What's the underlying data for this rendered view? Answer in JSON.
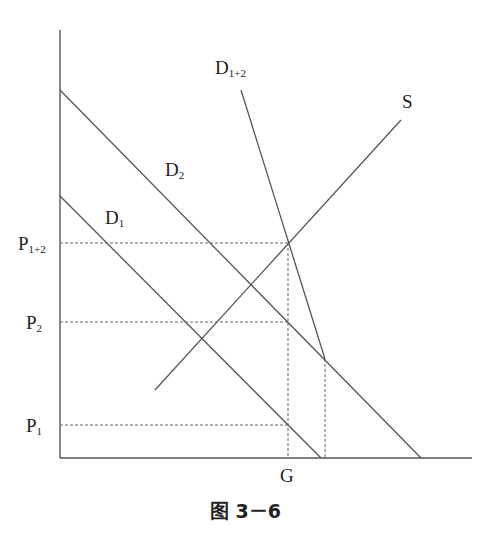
{
  "header_fragment": "",
  "diagram": {
    "type": "supply-demand",
    "axes": {
      "x_label": "",
      "y_label": ""
    },
    "curves": [
      {
        "id": "D1",
        "label_main": "D",
        "label_sub": "1"
      },
      {
        "id": "D2",
        "label_main": "D",
        "label_sub": "2"
      },
      {
        "id": "D1+2",
        "label_main": "D",
        "label_sub": "1+2"
      },
      {
        "id": "S",
        "label_main": "S",
        "label_sub": ""
      }
    ],
    "price_levels": [
      {
        "id": "P1+2",
        "label_main": "P",
        "label_sub": "1+2"
      },
      {
        "id": "P2",
        "label_main": "P",
        "label_sub": "2"
      },
      {
        "id": "P1",
        "label_main": "P",
        "label_sub": "1"
      }
    ],
    "quantity_levels": [
      {
        "id": "G",
        "label": "G"
      }
    ],
    "caption": "图 3－6"
  },
  "colors": {
    "line": "#555555",
    "dashed": "#666666",
    "text": "#222222"
  }
}
